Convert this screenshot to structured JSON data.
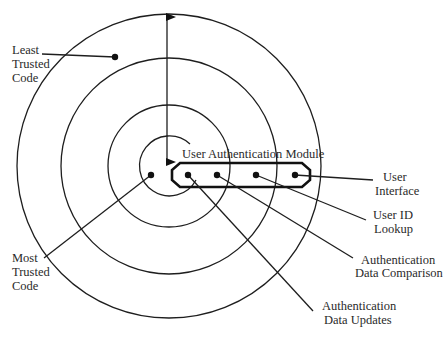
{
  "diagram": {
    "type": "concentric-trust-rings",
    "center": {
      "x": 168,
      "y": 166
    },
    "rings": [
      {
        "name": "ring-1-outer",
        "r": 151
      },
      {
        "name": "ring-2",
        "r": 108
      },
      {
        "name": "ring-3",
        "r": 61
      },
      {
        "name": "ring-4-inner",
        "r": 30
      }
    ],
    "module": {
      "title": "User Authentication Module",
      "components": [
        {
          "label_lines": [
            "Authentication",
            "Data Updates"
          ],
          "dot": {
            "x": 188,
            "y": 175
          },
          "end": {
            "x": 313,
            "y": 311
          }
        },
        {
          "label_lines": [
            "Authentication",
            "Data Comparison"
          ],
          "dot": {
            "x": 217,
            "y": 175
          },
          "end": {
            "x": 353,
            "y": 258
          }
        },
        {
          "label_lines": [
            "User ID",
            "Lookup"
          ],
          "dot": {
            "x": 256,
            "y": 175
          },
          "end": {
            "x": 366,
            "y": 220
          }
        },
        {
          "label_lines": [
            "User",
            "Interface"
          ],
          "dot": {
            "x": 295,
            "y": 175
          },
          "end": {
            "x": 373,
            "y": 180
          }
        }
      ]
    },
    "least_trusted": {
      "label_lines": [
        "Least",
        "Trusted",
        "Code"
      ]
    },
    "most_trusted": {
      "label_lines": [
        "Most",
        "Trusted",
        "Code"
      ]
    },
    "arrow": {
      "description": "double-headed arrow from outer ring to center"
    }
  },
  "labels": {
    "module_title": "User Authentication Module",
    "least_1": "Least",
    "least_2": "Trusted",
    "least_3": "Code",
    "most_1": "Most",
    "most_2": "Trusted",
    "most_3": "Code",
    "ui_1": "User",
    "ui_2": "Interface",
    "uid_1": "User ID",
    "uid_2": "Lookup",
    "cmp_1": "Authentication",
    "cmp_2": "Data Comparison",
    "upd_1": "Authentication",
    "upd_2": "Data Updates"
  }
}
